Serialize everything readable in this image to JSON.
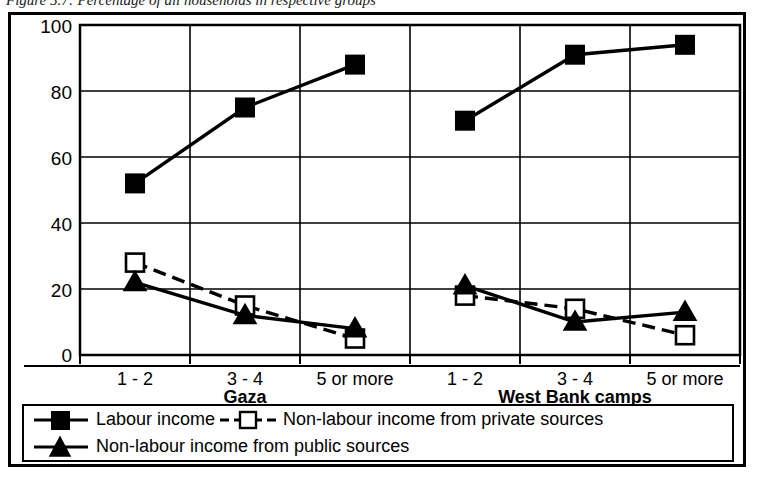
{
  "caption": "Figure 5.7: Percentage of all households in respective groups",
  "legend": {
    "entries": [
      {
        "label": "Labour income",
        "marker": "filled-square",
        "line": "solid",
        "color": "#000000"
      },
      {
        "label": "Non-labour income from private sources",
        "marker": "open-square",
        "line": "dashed",
        "color": "#000000"
      },
      {
        "label": "Non-labour income from public sources",
        "marker": "filled-triangle",
        "line": "solid",
        "color": "#000000"
      }
    ]
  },
  "chart_data": {
    "type": "line",
    "title": "Figure 5.7: Percentage of all households in respective groups",
    "xlabel": "",
    "ylabel": "",
    "ylim": [
      0,
      100
    ],
    "yticks": [
      0,
      20,
      40,
      60,
      80,
      100
    ],
    "grid": true,
    "legend_position": "bottom",
    "panels": [
      {
        "name": "Gaza",
        "categories": [
          "1 - 2",
          "3 - 4",
          "5 or more"
        ]
      },
      {
        "name": "West Bank camps",
        "categories": [
          "1 - 2",
          "3 - 4",
          "5 or more"
        ]
      }
    ],
    "categories": [
      "1 - 2",
      "3 - 4",
      "5 or more",
      "1 - 2",
      "3 - 4",
      "5 or more"
    ],
    "series": [
      {
        "name": "Labour income",
        "marker": "filled-square",
        "line": "solid",
        "values": [
          52,
          75,
          88,
          71,
          91,
          94
        ],
        "by_panel": {
          "Gaza": [
            52,
            75,
            88
          ],
          "West Bank camps": [
            71,
            91,
            94
          ]
        }
      },
      {
        "name": "Non-labour income from private sources",
        "marker": "open-square",
        "line": "dashed",
        "values": [
          28,
          15,
          5,
          18,
          14,
          6
        ],
        "by_panel": {
          "Gaza": [
            28,
            15,
            5
          ],
          "West Bank camps": [
            18,
            14,
            6
          ]
        }
      },
      {
        "name": "Non-labour income from public sources",
        "marker": "filled-triangle",
        "line": "solid",
        "values": [
          22,
          12,
          8,
          21,
          10,
          13
        ],
        "by_panel": {
          "Gaza": [
            22,
            12,
            8
          ],
          "West Bank camps": [
            21,
            10,
            13
          ]
        }
      }
    ]
  },
  "axis": {
    "ytick_labels": [
      "100",
      "80",
      "60",
      "40",
      "20",
      "0"
    ],
    "xtick_labels_gaza": [
      "1 - 2",
      "3 - 4",
      "5 or more"
    ],
    "xtick_labels_wb": [
      "1 - 2",
      "3 - 4",
      "5 or more"
    ],
    "group_label_gaza": "Gaza",
    "group_label_wb": "West Bank camps"
  }
}
